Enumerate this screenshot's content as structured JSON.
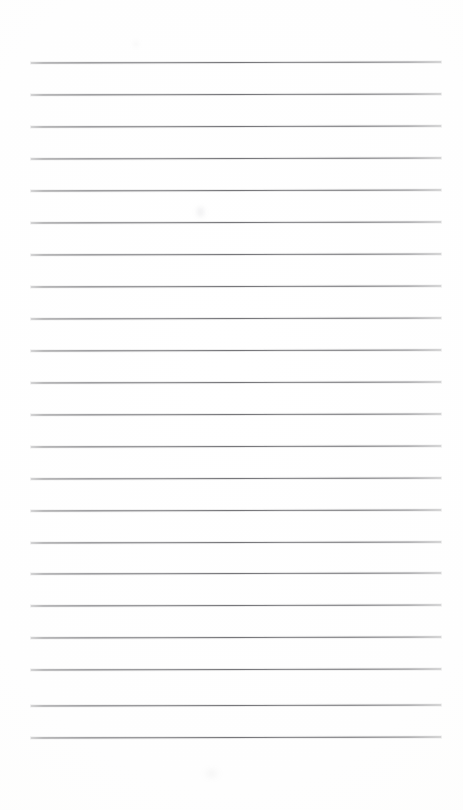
{
  "document": {
    "kind": "lined-notebook-paper-scan",
    "title": "Blank Ruled Paper",
    "page_width_px": 463,
    "page_height_px": 810,
    "background_color": "#fefefe",
    "has_text_content": false,
    "has_handwriting": false,
    "has_header": false,
    "has_footer": false,
    "has_margin_rule": false,
    "has_page_number": false,
    "orientation": "portrait"
  },
  "ruling": {
    "line_count": 22,
    "line_color": "#747478",
    "line_thickness_px": 1,
    "first_line_y_px": 62,
    "last_line_y_px": 737,
    "line_spacing_px": 32.1,
    "line_left_x_px": 31,
    "line_right_x_px": 441,
    "line_length_px": 410,
    "top_margin_px": 62,
    "bottom_margin_px": 73,
    "left_margin_px": 31,
    "right_margin_px": 22,
    "lines": [
      {
        "index": 1,
        "y": 62,
        "x1": 31,
        "x2": 441
      },
      {
        "index": 2,
        "y": 94,
        "x1": 31,
        "x2": 441
      },
      {
        "index": 3,
        "y": 126,
        "x1": 31,
        "x2": 441
      },
      {
        "index": 4,
        "y": 158,
        "x1": 31,
        "x2": 441
      },
      {
        "index": 5,
        "y": 190,
        "x1": 31,
        "x2": 441
      },
      {
        "index": 6,
        "y": 222,
        "x1": 31,
        "x2": 441
      },
      {
        "index": 7,
        "y": 254,
        "x1": 31,
        "x2": 441
      },
      {
        "index": 8,
        "y": 286,
        "x1": 31,
        "x2": 441
      },
      {
        "index": 9,
        "y": 318,
        "x1": 31,
        "x2": 441
      },
      {
        "index": 10,
        "y": 350,
        "x1": 31,
        "x2": 441
      },
      {
        "index": 11,
        "y": 382,
        "x1": 31,
        "x2": 441
      },
      {
        "index": 12,
        "y": 414,
        "x1": 31,
        "x2": 441
      },
      {
        "index": 13,
        "y": 446,
        "x1": 31,
        "x2": 441
      },
      {
        "index": 14,
        "y": 478,
        "x1": 31,
        "x2": 441
      },
      {
        "index": 15,
        "y": 510,
        "x1": 31,
        "x2": 441
      },
      {
        "index": 16,
        "y": 542,
        "x1": 31,
        "x2": 441
      },
      {
        "index": 17,
        "y": 573,
        "x1": 31,
        "x2": 441
      },
      {
        "index": 18,
        "y": 605,
        "x1": 31,
        "x2": 441
      },
      {
        "index": 19,
        "y": 637,
        "x1": 31,
        "x2": 441
      },
      {
        "index": 20,
        "y": 669,
        "x1": 31,
        "x2": 441
      },
      {
        "index": 21,
        "y": 705,
        "x1": 31,
        "x2": 441
      },
      {
        "index": 22,
        "y": 737,
        "x1": 31,
        "x2": 441
      }
    ]
  },
  "artifacts": {
    "smudges": [
      {
        "name": "smudge-upper",
        "x": 197,
        "y": 207,
        "w": 7,
        "h": 10
      },
      {
        "name": "smudge-lower",
        "x": 205,
        "y": 770,
        "w": 13,
        "h": 7
      },
      {
        "name": "smudge-top",
        "x": 133,
        "y": 41,
        "w": 6,
        "h": 6
      }
    ]
  }
}
